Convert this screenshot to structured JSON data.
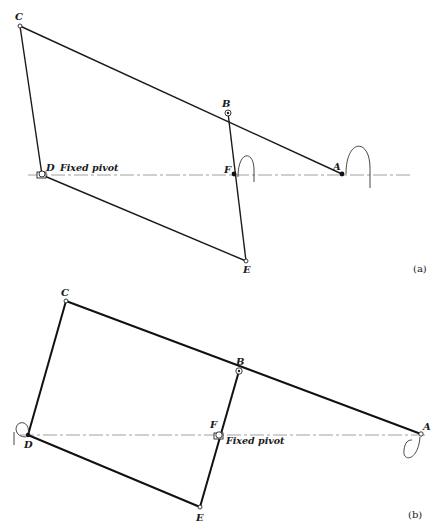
{
  "figures": [
    {
      "caption": "(a)",
      "points": {
        "A": {
          "label": "A",
          "x": 342,
          "y": 174
        },
        "B": {
          "label": "B",
          "x": 228,
          "y": 113
        },
        "C": {
          "label": "C",
          "x": 20,
          "y": 26
        },
        "D": {
          "label": "D",
          "x": 42,
          "y": 175
        },
        "E": {
          "label": "E",
          "x": 246,
          "y": 261
        },
        "F": {
          "label": "F",
          "x": 234,
          "y": 174
        }
      },
      "fixed_pivot_label": "Fixed pivot",
      "fixed_pivot_at": "D"
    },
    {
      "caption": "(b)",
      "points": {
        "A": {
          "label": "A",
          "x": 421,
          "y": 434
        },
        "B": {
          "label": "B",
          "x": 239,
          "y": 371
        },
        "C": {
          "label": "C",
          "x": 66,
          "y": 301
        },
        "D": {
          "label": "D",
          "x": 28,
          "y": 435
        },
        "E": {
          "label": "E",
          "x": 200,
          "y": 507
        },
        "F": {
          "label": "F",
          "x": 219,
          "y": 435
        }
      },
      "fixed_pivot_label": "Fixed pivot",
      "fixed_pivot_at": "F"
    }
  ]
}
